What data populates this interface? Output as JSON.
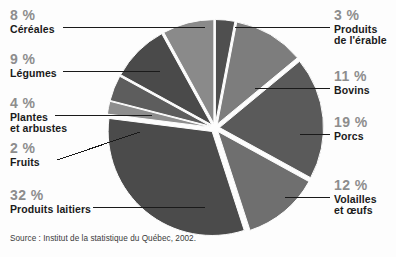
{
  "chart_data": {
    "type": "pie",
    "title": "",
    "subtitle": "",
    "xlabel": "",
    "ylabel": "",
    "legend_position": "callout-labels",
    "grid": false,
    "unit": "%",
    "total": 100,
    "categories": [
      "Produits de l'érable",
      "Bovins",
      "Porcs",
      "Volailles et œufs",
      "Produits laitiers",
      "Fruits",
      "Plantes et arbustes",
      "Légumes",
      "Céréales"
    ],
    "values": [
      3,
      11,
      19,
      12,
      32,
      2,
      4,
      9,
      8
    ],
    "slices": [
      {
        "label_line1": "Produits",
        "label_line2": "de l'érable",
        "pct_text": "3 %",
        "value": 3,
        "color": "#4f4f4f",
        "start_deg": 0,
        "end_deg": 10.8,
        "side": "right"
      },
      {
        "label_line1": "Bovins",
        "label_line2": "",
        "pct_text": "11 %",
        "value": 11,
        "color": "#7d7d7d",
        "start_deg": 10.8,
        "end_deg": 50.4,
        "side": "right"
      },
      {
        "label_line1": "Porcs",
        "label_line2": "",
        "pct_text": "19 %",
        "value": 19,
        "color": "#5a5a5a",
        "start_deg": 50.4,
        "end_deg": 118.8,
        "side": "right"
      },
      {
        "label_line1": "Volailles",
        "label_line2": "et œufs",
        "pct_text": "12 %",
        "value": 12,
        "color": "#6f6f6f",
        "start_deg": 118.8,
        "end_deg": 162.0,
        "side": "right"
      },
      {
        "label_line1": "Produits laitiers",
        "label_line2": "",
        "pct_text": "32 %",
        "value": 32,
        "color": "#4b4b4b",
        "start_deg": 162.0,
        "end_deg": 277.2,
        "side": "left"
      },
      {
        "label_line1": "Fruits",
        "label_line2": "",
        "pct_text": "2 %",
        "value": 2,
        "color": "#8e8e8e",
        "start_deg": 277.2,
        "end_deg": 284.4,
        "side": "left"
      },
      {
        "label_line1": "Plantes",
        "label_line2": "et arbustes",
        "pct_text": "4 %",
        "value": 4,
        "color": "#5d5d5d",
        "start_deg": 284.4,
        "end_deg": 298.8,
        "side": "left"
      },
      {
        "label_line1": "Légumes",
        "label_line2": "",
        "pct_text": "9 %",
        "value": 9,
        "color": "#4a4a4a",
        "start_deg": 298.8,
        "end_deg": 331.2,
        "side": "left"
      },
      {
        "label_line1": "Céréales",
        "label_line2": "",
        "pct_text": "8 %",
        "value": 8,
        "color": "#8a8a8a",
        "start_deg": 331.2,
        "end_deg": 360.0,
        "side": "left"
      }
    ],
    "colors": {
      "dark_gray": "#4b4b4b",
      "mid_gray": "#7d7d7d",
      "light_gray": "#8e8e8e",
      "pct_text": "#8d8d8d",
      "name_text": "#1a1a1a",
      "leader_line": "#1a1a1a",
      "background": "#fdfdfd"
    }
  },
  "source": {
    "text": "Source : Institut de la statistique du Québec, 2002."
  },
  "labels": {
    "cereales": {
      "pct": "8 %",
      "l1": "Céréales",
      "l2": ""
    },
    "legumes": {
      "pct": "9 %",
      "l1": "Légumes",
      "l2": ""
    },
    "plantes": {
      "pct": "4 %",
      "l1": "Plantes",
      "l2": "et arbustes"
    },
    "fruits": {
      "pct": "2 %",
      "l1": "Fruits",
      "l2": ""
    },
    "laitiers": {
      "pct": "32 %",
      "l1": "Produits laitiers",
      "l2": ""
    },
    "erable": {
      "pct": "3 %",
      "l1": "Produits",
      "l2": "de l'érable"
    },
    "bovins": {
      "pct": "11 %",
      "l1": "Bovins",
      "l2": ""
    },
    "porcs": {
      "pct": "19 %",
      "l1": "Porcs",
      "l2": ""
    },
    "volailles": {
      "pct": "12 %",
      "l1": "Volailles",
      "l2": "et œufs"
    }
  }
}
